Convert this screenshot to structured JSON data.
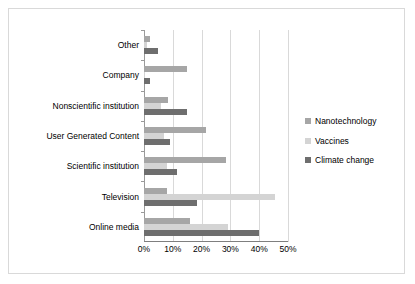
{
  "chart_data": {
    "type": "bar",
    "orientation": "horizontal",
    "title": "",
    "xlabel": "",
    "ylabel": "",
    "xlim": [
      0,
      50
    ],
    "xticks": [
      "0%",
      "10%",
      "20%",
      "30%",
      "40%",
      "50%"
    ],
    "xtick_values": [
      0,
      10,
      20,
      30,
      40,
      50
    ],
    "grid": "vertical",
    "legend_position": "right",
    "categories": [
      "Online media",
      "Television",
      "Scientific institution",
      "User Generated Content",
      "Nonscientific institution",
      "Company",
      "Other"
    ],
    "series": [
      {
        "name": "Nanotechnology",
        "color": "#a6a6a6",
        "values": [
          16.0,
          8.0,
          28.5,
          21.5,
          8.5,
          15.0,
          2.0
        ]
      },
      {
        "name": "Vaccines",
        "color": "#d4d4d4",
        "values": [
          29.0,
          45.5,
          8.0,
          7.0,
          6.0,
          0.5,
          1.0
        ]
      },
      {
        "name": "Climate change",
        "color": "#6e6e6e",
        "values": [
          40.0,
          18.5,
          11.5,
          9.0,
          15.0,
          2.0,
          5.0
        ]
      }
    ]
  }
}
